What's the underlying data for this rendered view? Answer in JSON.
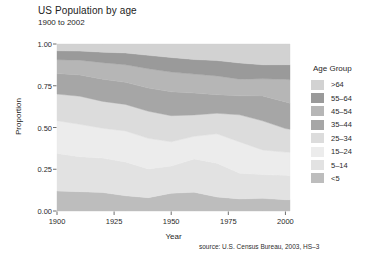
{
  "title": "US Population by age",
  "subtitle": "1900 to 2002",
  "source": "source: U.S. Census Bureau, 2003, HS–3",
  "legend": {
    "title": "Age Group",
    "entries": [
      {
        "label": ">64",
        "color": "#d2d2d2"
      },
      {
        "label": "55–64",
        "color": "#9a9a9a"
      },
      {
        "label": "45–54",
        "color": "#b6b6b6"
      },
      {
        "label": "35–44",
        "color": "#a6a6a6"
      },
      {
        "label": "25–34",
        "color": "#dcdcdc"
      },
      {
        "label": "15–24",
        "color": "#ececec"
      },
      {
        "label": "5–14",
        "color": "#e2e2e2"
      },
      {
        "label": "<5",
        "color": "#bdbdbd"
      }
    ]
  },
  "axes": {
    "y_label": "Proportion",
    "x_label": "Year",
    "y_ticks": [
      "0.00",
      "0.25",
      "0.50",
      "0.75",
      "1.00"
    ],
    "x_ticks": [
      "1900",
      "1925",
      "1950",
      "1975",
      "2000"
    ]
  },
  "chart_data": {
    "type": "area",
    "title": "US Population by age",
    "subtitle": "1900 to 2002",
    "xlabel": "Year",
    "ylabel": "Proportion",
    "xlim": [
      1900,
      2002
    ],
    "ylim": [
      0,
      1
    ],
    "grid": false,
    "legend_position": "right",
    "stacked": true,
    "stack_order_bottom_to_top": [
      "<5",
      "5–14",
      "15–24",
      "25–34",
      "35–44",
      "45–54",
      "55–64",
      ">64"
    ],
    "annotation": "source: U.S. Census Bureau, 2003, HS–3",
    "x": [
      1900,
      1910,
      1920,
      1930,
      1940,
      1950,
      1960,
      1970,
      1980,
      1990,
      2000,
      2002
    ],
    "series": [
      {
        "name": "<5",
        "color": "#bdbdbd",
        "values": [
          0.121,
          0.117,
          0.111,
          0.092,
          0.08,
          0.106,
          0.112,
          0.084,
          0.072,
          0.076,
          0.068,
          0.068
        ]
      },
      {
        "name": "5–14",
        "color": "#e2e2e2",
        "values": [
          0.227,
          0.211,
          0.206,
          0.203,
          0.172,
          0.163,
          0.197,
          0.202,
          0.152,
          0.143,
          0.146,
          0.143
        ]
      },
      {
        "name": "15–24",
        "color": "#ececec",
        "values": [
          0.198,
          0.196,
          0.179,
          0.187,
          0.183,
          0.145,
          0.135,
          0.175,
          0.186,
          0.148,
          0.139,
          0.141
        ]
      },
      {
        "name": "25–34",
        "color": "#dcdcdc",
        "values": [
          0.161,
          0.17,
          0.161,
          0.16,
          0.162,
          0.156,
          0.127,
          0.123,
          0.161,
          0.175,
          0.141,
          0.137
        ]
      },
      {
        "name": "35–44",
        "color": "#a6a6a6",
        "values": [
          0.124,
          0.129,
          0.133,
          0.133,
          0.139,
          0.143,
          0.13,
          0.111,
          0.113,
          0.15,
          0.16,
          0.156
        ]
      },
      {
        "name": "45–54",
        "color": "#b6b6b6",
        "values": [
          0.084,
          0.089,
          0.099,
          0.106,
          0.116,
          0.118,
          0.113,
          0.112,
          0.099,
          0.103,
          0.135,
          0.14
        ]
      },
      {
        "name": "55–64",
        "color": "#9a9a9a",
        "values": [
          0.054,
          0.055,
          0.063,
          0.071,
          0.08,
          0.087,
          0.087,
          0.092,
          0.096,
          0.084,
          0.088,
          0.09
        ]
      },
      {
        "name": ">64",
        "color": "#d2d2d2",
        "values": [
          0.041,
          0.043,
          0.049,
          0.054,
          0.068,
          0.081,
          0.092,
          0.099,
          0.113,
          0.125,
          0.124,
          0.124
        ]
      }
    ]
  },
  "plot_geometry": {
    "left": 57,
    "right": 290,
    "top": 44,
    "bottom": 211
  }
}
